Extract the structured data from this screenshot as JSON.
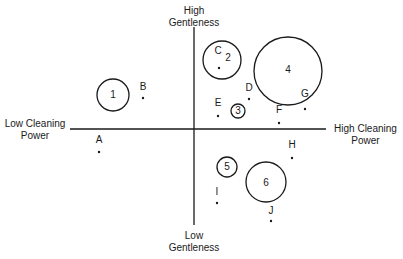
{
  "axes": {
    "top_label_line1": "High",
    "top_label_line2": "Gentleness",
    "bottom_label_line1": "Low",
    "bottom_label_line2": "Gentleness",
    "left_label_line1": "Low Cleaning",
    "left_label_line2": "Power",
    "right_label_line1": "High Cleaning",
    "right_label_line2": "Power"
  },
  "circles": [
    {
      "id": "1",
      "cx": 113,
      "cy": 95,
      "r": 16,
      "lx": 113,
      "ly": 98
    },
    {
      "id": "2",
      "cx": 222,
      "cy": 60,
      "r": 19,
      "lx": 228,
      "ly": 61
    },
    {
      "id": "3",
      "cx": 238,
      "cy": 111,
      "r": 7,
      "lx": 238,
      "ly": 114
    },
    {
      "id": "4",
      "cx": 288,
      "cy": 71,
      "r": 34,
      "lx": 288,
      "ly": 73
    },
    {
      "id": "5",
      "cx": 227,
      "cy": 167,
      "r": 10,
      "lx": 227,
      "ly": 170
    },
    {
      "id": "6",
      "cx": 266,
      "cy": 182,
      "r": 20,
      "lx": 266,
      "ly": 186
    }
  ],
  "points": [
    {
      "id": "A",
      "lx": 99,
      "ly": 143,
      "dx": 99,
      "dy": 152
    },
    {
      "id": "B",
      "lx": 143,
      "ly": 90,
      "dx": 143,
      "dy": 98
    },
    {
      "id": "C",
      "lx": 218,
      "ly": 54,
      "dx": 219,
      "dy": 68
    },
    {
      "id": "D",
      "lx": 249,
      "ly": 91,
      "dx": 249,
      "dy": 99
    },
    {
      "id": "E",
      "lx": 218,
      "ly": 106,
      "dx": 218,
      "dy": 116
    },
    {
      "id": "F",
      "lx": 279,
      "ly": 113,
      "dx": 279,
      "dy": 123
    },
    {
      "id": "G",
      "lx": 305,
      "ly": 97,
      "dx": 305,
      "dy": 109
    },
    {
      "id": "H",
      "lx": 292,
      "ly": 148,
      "dx": 292,
      "dy": 158
    },
    {
      "id": "I",
      "lx": 217,
      "ly": 195,
      "dx": 217,
      "dy": 203
    },
    {
      "id": "J",
      "lx": 271,
      "ly": 214,
      "dx": 271,
      "dy": 221
    }
  ]
}
